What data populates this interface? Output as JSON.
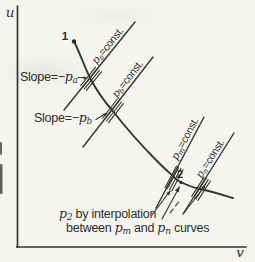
{
  "figure": {
    "paper_color": "#f5f4ef",
    "ink_color": "#2e2e2e",
    "axis": {
      "y_label": "u",
      "x_label": "v"
    },
    "points": {
      "p1": "1",
      "p2": "2"
    },
    "iso_labels": [
      {
        "sym": "p",
        "sub": "a",
        "rest": "=const."
      },
      {
        "sym": "p",
        "sub": "b",
        "rest": "=const."
      },
      {
        "sym": "p",
        "sub": "m",
        "rest": "=const."
      },
      {
        "sym": "p",
        "sub": "n",
        "rest": "=const."
      }
    ],
    "slope_a": {
      "pre": "Slope=−",
      "sym": "p",
      "sub": "a"
    },
    "slope_b": {
      "pre": "Slope=−",
      "sym": "p",
      "sub": "b"
    },
    "note": {
      "l1_sym": "p",
      "l1_sub": "2",
      "l1_rest": " by interpolation",
      "l2_pre": "between ",
      "m_sym": "p",
      "m_sub": "m",
      "mid": " and ",
      "n_sym": "p",
      "n_sub": "n",
      "post": " curves"
    }
  }
}
